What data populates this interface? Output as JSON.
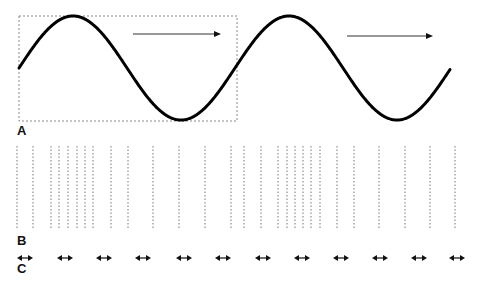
{
  "panels": {
    "A": {
      "label": "A",
      "description": "Sine wave with dashed one-wavelength box and rightward propagation arrows",
      "wave": {
        "x_start": 19,
        "x_end": 450,
        "mid_y": 68,
        "amplitude": 52,
        "wavelength": 216,
        "phase_start": 0,
        "stroke": "#000000",
        "stroke_width": 3
      },
      "box": {
        "x": 19,
        "y": 16,
        "width": 218,
        "height": 105,
        "stroke": "#888888"
      },
      "arrows": [
        {
          "x1": 133,
          "x2": 221,
          "y": 34
        },
        {
          "x1": 347,
          "x2": 433,
          "y": 36
        }
      ]
    },
    "B": {
      "label": "B",
      "description": "Dotted vertical lines showing compressions and rarefactions",
      "y_top": 146,
      "y_bottom": 230,
      "line_x": [
        17,
        33,
        51,
        59,
        68,
        77,
        85,
        93,
        111,
        128,
        153,
        179,
        205,
        231,
        244,
        261,
        278,
        287,
        295,
        303,
        311,
        320,
        337,
        354,
        379,
        405,
        430,
        455
      ],
      "stroke": "#777777"
    },
    "C": {
      "label": "C",
      "description": "Double-headed arrows showing particle oscillation",
      "y": 258,
      "arrow_centers": [
        25,
        65,
        104,
        143,
        184,
        223,
        263,
        302,
        341,
        380,
        419,
        457
      ],
      "arrow_half_width": 8
    }
  }
}
